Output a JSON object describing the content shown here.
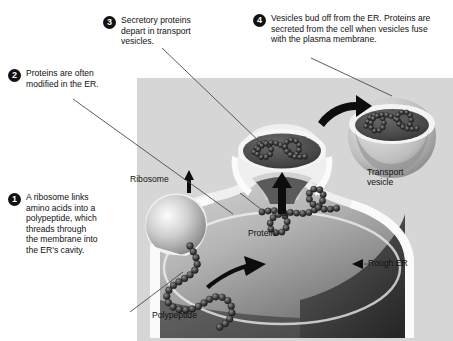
{
  "figure": {
    "panel_background": "#d6d6d6"
  },
  "steps": [
    {
      "number": "1",
      "text": "A ribosome links amino acids into a polypeptide, which threads through the membrane into the ER's cavity."
    },
    {
      "number": "2",
      "text": "Proteins are often modified in the ER."
    },
    {
      "number": "3",
      "text": "Secretory proteins depart in transport vesicles."
    },
    {
      "number": "4",
      "text": "Vesicles bud off from the ER. Proteins are secreted from the cell when vesicles fuse with the plasma membrane."
    }
  ],
  "labels": {
    "ribosome": "Ribosome",
    "protein": "Protein",
    "polypeptide": "Polypeptide",
    "transport_vesicle": "Transport vesicle",
    "rough_er": "Rough ER"
  },
  "colors": {
    "badge_fill": "#111111",
    "badge_text": "#ffffff",
    "panel": "#d6d6d6",
    "membrane_light": "#efefef",
    "lumen_light": "#c9c9c9",
    "lumen_dark": "#3a3a3a",
    "bead_dark": "#2b2b2b",
    "arrow": "#0d0d0d",
    "leader_line": "#4a4a4a"
  }
}
